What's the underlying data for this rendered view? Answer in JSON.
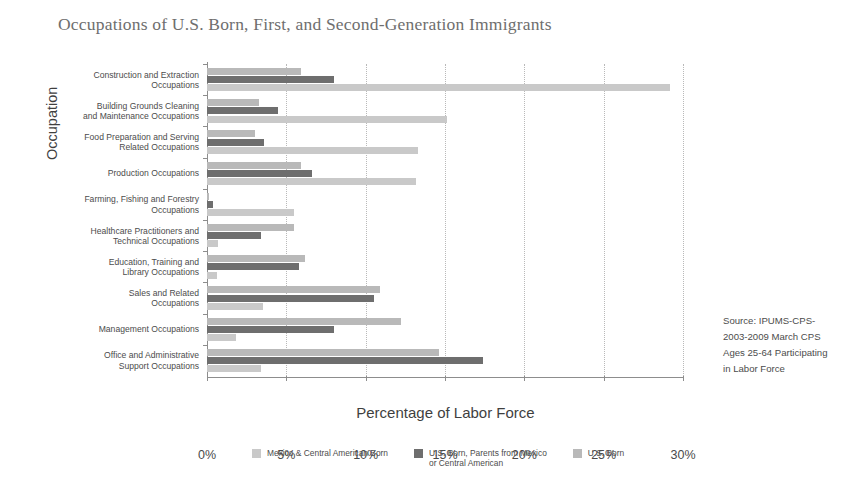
{
  "chart_data": {
    "type": "bar",
    "orientation": "horizontal",
    "title": "Occupations of U.S. Born, First, and Second-Generation Immigrants",
    "xlabel": "Percentage of Labor Force",
    "ylabel": "Occupation",
    "xlim": [
      0,
      30
    ],
    "xticks": [
      0,
      5,
      10,
      15,
      20,
      25,
      30
    ],
    "xtick_labels": [
      "0%",
      "5%",
      "10%",
      "15%",
      "20%",
      "25%",
      "30%"
    ],
    "grid": "vertical-dotted",
    "legend_position": "bottom",
    "categories": [
      "Construction and Extraction Occupations",
      "Building Grounds Cleaning and Maintenance Occupations",
      "Food Preparation and Serving Related Occupations",
      "Production Occupations",
      "Farming, Fishing and Forestry Occupations",
      "Healthcare Practitioners and Technical Occupations",
      "Education, Training and Library Occupations",
      "Sales and Related Occupations",
      "Management Occupations",
      "Office and Administrative Support Occupations"
    ],
    "series": [
      {
        "name": "U.S. Born",
        "color": "#b9b9b9",
        "values": [
          5.9,
          3.3,
          3.0,
          5.9,
          0.1,
          5.5,
          6.2,
          10.9,
          12.2,
          14.6
        ]
      },
      {
        "name": "U.S. Born, Parents from Mexico or Central American",
        "color": "#6e6e6e",
        "values": [
          8.0,
          4.5,
          3.6,
          6.6,
          0.4,
          3.4,
          5.8,
          10.5,
          8.0,
          17.4
        ]
      },
      {
        "name": "Mexico & Central American Born",
        "color": "#c9c9c9",
        "values": [
          29.2,
          15.1,
          13.3,
          13.2,
          5.5,
          0.7,
          0.6,
          3.5,
          1.8,
          3.4
        ]
      }
    ]
  },
  "legend": {
    "items": [
      {
        "label": "Mexico & Central American Born",
        "color": "#c9c9c9"
      },
      {
        "label": "U.S. Born, Parents from Mexico\nor Central American",
        "color": "#6e6e6e"
      },
      {
        "label": "U.S. Born",
        "color": "#b9b9b9"
      }
    ]
  },
  "source_note": {
    "lines": [
      "Source: IPUMS-CPS-",
      "2003-2009 March CPS",
      "Ages 25-64 Participating",
      "in Labor Force"
    ]
  }
}
